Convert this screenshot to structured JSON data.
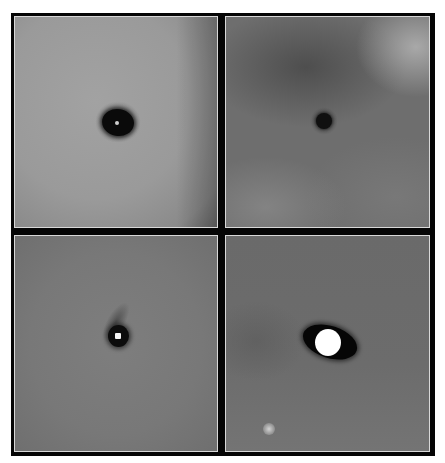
{
  "figure": {
    "layout": "2x2 grid",
    "frame_color": "#050505",
    "panel_border_color": "#d8d8d8",
    "panels": [
      {
        "position": "top-left",
        "background": "#9a9a9a",
        "background_edge": "#6e6e6e",
        "feature": "dark elliptical core with small bright central point",
        "core": {
          "cx": 103,
          "cy": 105,
          "rx": 16,
          "ry": 14,
          "color": "#0a0a0a"
        },
        "center_point": {
          "cx": 102,
          "cy": 106,
          "r": 2,
          "color": "#cfcfcf"
        }
      },
      {
        "position": "top-right",
        "background": "#6a6a6a",
        "background_light": "#a5a5a5",
        "feature": "small dark circular core, mottled cloudy background",
        "core": {
          "cx": 98,
          "cy": 104,
          "r": 8,
          "color": "#101010"
        }
      },
      {
        "position": "bottom-left",
        "background": "#7a7a7a",
        "feature": "dark diagonal streak with bright white point",
        "core": {
          "cx": 103,
          "cy": 100,
          "rx": 10,
          "ry": 11,
          "color": "#0c0c0c"
        },
        "center_point": {
          "cx": 103,
          "cy": 100,
          "r": 3,
          "color": "#f5f5f5"
        }
      },
      {
        "position": "bottom-right",
        "background": "#6b6b6b",
        "feature": "bright white core inside dark tilted elliptical disk; faint point source lower-left",
        "disk": {
          "cx": 104,
          "cy": 106,
          "rx": 28,
          "ry": 16,
          "rotate": 18,
          "color": "#060606"
        },
        "core": {
          "cx": 102,
          "cy": 106,
          "rx": 13,
          "ry": 13,
          "color": "#ffffff"
        },
        "faint_source": {
          "cx": 43,
          "cy": 193,
          "r": 5,
          "color": "#c8c8c8"
        }
      }
    ]
  }
}
